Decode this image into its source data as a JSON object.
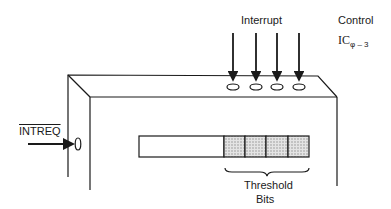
{
  "diagram": {
    "labels": {
      "interrupt": "Interrupt",
      "control": "Control",
      "ic_main": "IC",
      "ic_sub": "φ – 3",
      "intreq": "INTREQ",
      "threshold_line1": "Threshold",
      "threshold_line2": "Bits"
    },
    "interrupt_inputs": 4,
    "register": {
      "plain_segments": 1,
      "threshold_cells": 4
    },
    "colors": {
      "stroke": "#1a1a1a",
      "shade": "#cfcfcf",
      "background": "#ffffff"
    }
  }
}
